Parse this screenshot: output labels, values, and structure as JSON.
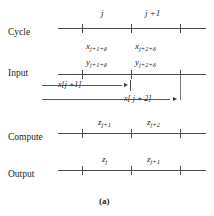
{
  "figure": {
    "caption": "(a)",
    "rows": [
      {
        "id": "cycle",
        "label": "Cycle",
        "marks": [
          "j",
          "j +1"
        ]
      },
      {
        "id": "input",
        "label": "Input",
        "marks_x": [
          "x",
          "x"
        ],
        "marks_x_sub": [
          "j+1+δ",
          "j+2+δ"
        ],
        "marks_y": [
          "y",
          "y"
        ],
        "marks_y_sub": [
          "j+1+δ",
          "j+2+δ"
        ],
        "arrows": [
          "x[j +1]",
          "x[ j + 2]"
        ]
      },
      {
        "id": "compute",
        "label": "Compute",
        "marks": [
          "z",
          "z"
        ],
        "marks_sub": [
          "j+1",
          "j+2"
        ]
      },
      {
        "id": "output",
        "label": "Output",
        "marks": [
          "z",
          "z"
        ],
        "marks_sub": [
          "j",
          "j+1"
        ]
      }
    ]
  },
  "colors": {
    "line": "#4a4a4a",
    "text": "#231f20",
    "background": "#ffffff"
  }
}
